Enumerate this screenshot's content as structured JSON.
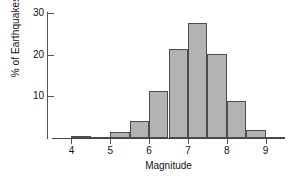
{
  "chart_data": {
    "type": "bar",
    "title": "",
    "subtitle": "",
    "xlabel": "Magnitude",
    "ylabel": "% of Earthquakes",
    "xlim": [
      3.5,
      9.5
    ],
    "ylim": [
      0,
      30
    ],
    "bin_width": 0.5,
    "grid": false,
    "legend": null,
    "xticks": [
      "4",
      "5",
      "6",
      "7",
      "8",
      "9"
    ],
    "xtick_values": [
      4,
      5,
      6,
      7,
      8,
      9
    ],
    "yticks": [
      "10",
      "20",
      "30"
    ],
    "ytick_values": [
      10,
      20,
      30
    ],
    "bar_color": "#b3b3b3",
    "bar_edge_color": "#4d4d4d",
    "axis_color": "#555555",
    "bins": [
      {
        "start": 3.5,
        "end": 4.0,
        "value": 0.0
      },
      {
        "start": 4.0,
        "end": 4.5,
        "value": 0.6
      },
      {
        "start": 4.5,
        "end": 5.0,
        "value": 0.3
      },
      {
        "start": 5.0,
        "end": 5.5,
        "value": 1.4
      },
      {
        "start": 5.5,
        "end": 6.0,
        "value": 4.1
      },
      {
        "start": 6.0,
        "end": 6.5,
        "value": 11.2
      },
      {
        "start": 6.5,
        "end": 7.0,
        "value": 21.3
      },
      {
        "start": 7.0,
        "end": 7.5,
        "value": 27.6
      },
      {
        "start": 7.5,
        "end": 8.0,
        "value": 20.2
      },
      {
        "start": 8.0,
        "end": 8.5,
        "value": 9.0
      },
      {
        "start": 8.5,
        "end": 9.0,
        "value": 1.9
      },
      {
        "start": 9.0,
        "end": 9.5,
        "value": 0.3
      }
    ]
  }
}
